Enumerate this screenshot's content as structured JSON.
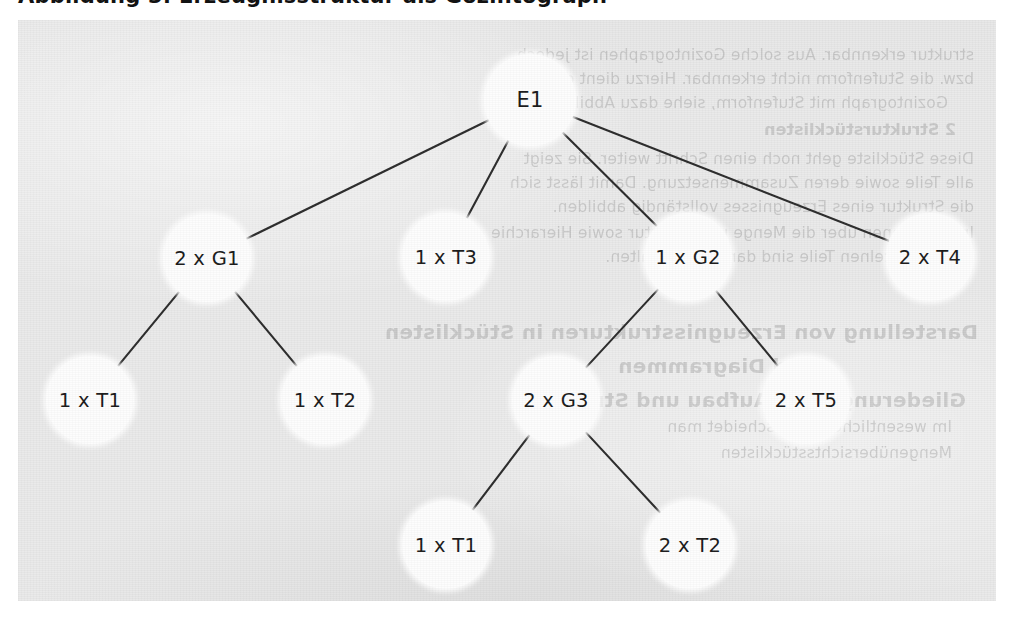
{
  "page": {
    "heading_cutoff": "Abbildung 3: Erzeugnisstruktur als Gozintograph",
    "panel_color": "#e9e9e9",
    "node_fill": "#fdfdfd",
    "line_color": "#2b2b2b",
    "text_color": "#1a1a1a"
  },
  "diagram": {
    "type": "tree",
    "nodes": [
      {
        "id": "E1",
        "label": "E1",
        "level": 0,
        "cx": 530,
        "cy": 100,
        "r": 46
      },
      {
        "id": "G1",
        "label": "2 x G1",
        "level": 1,
        "cx": 207,
        "cy": 258,
        "r": 44
      },
      {
        "id": "T3",
        "label": "1 x T3",
        "level": 1,
        "cx": 446,
        "cy": 257,
        "r": 44
      },
      {
        "id": "G2",
        "label": "1 x G2",
        "level": 1,
        "cx": 688,
        "cy": 257,
        "r": 44
      },
      {
        "id": "T4",
        "label": "2 x T4",
        "level": 1,
        "cx": 930,
        "cy": 257,
        "r": 44
      },
      {
        "id": "T1a",
        "label": "1 x T1",
        "level": 2,
        "cx": 90,
        "cy": 400,
        "r": 44
      },
      {
        "id": "T2a",
        "label": "1 x T2",
        "level": 2,
        "cx": 325,
        "cy": 400,
        "r": 44
      },
      {
        "id": "G3",
        "label": "2 x G3",
        "level": 2,
        "cx": 556,
        "cy": 400,
        "r": 44
      },
      {
        "id": "T5",
        "label": "2 x T5",
        "level": 2,
        "cx": 806,
        "cy": 400,
        "r": 44
      },
      {
        "id": "T1b",
        "label": "1 x T1",
        "level": 3,
        "cx": 446,
        "cy": 545,
        "r": 44
      },
      {
        "id": "T2b",
        "label": "2 x T2",
        "level": 3,
        "cx": 690,
        "cy": 545,
        "r": 44
      }
    ],
    "edges": [
      {
        "from": "E1",
        "to": "G1"
      },
      {
        "from": "E1",
        "to": "T3"
      },
      {
        "from": "E1",
        "to": "G2"
      },
      {
        "from": "E1",
        "to": "T4"
      },
      {
        "from": "G1",
        "to": "T1a"
      },
      {
        "from": "G1",
        "to": "T2a"
      },
      {
        "from": "G2",
        "to": "G3"
      },
      {
        "from": "G2",
        "to": "T5"
      },
      {
        "from": "G3",
        "to": "T1b"
      },
      {
        "from": "G3",
        "to": "T2b"
      }
    ]
  },
  "bleed_text": {
    "note": "faint mirrored show-through from reverse side of the scanned page",
    "lines": [
      {
        "text": "struktur erkennbar. Aus solche Gozintographen ist jedoch",
        "x": 22,
        "y": 26,
        "cls": "b-body"
      },
      {
        "text": "bzw. die Stufenform nicht erkennbar. Hierzu dient die",
        "x": 22,
        "y": 50,
        "cls": "b-body"
      },
      {
        "text": "Gozintograph mit Stufenform, siehe dazu Abbildung 4.",
        "x": 48,
        "y": 74,
        "cls": "b-body"
      },
      {
        "text": "2  Strukturstücklisten",
        "x": 40,
        "y": 100,
        "cls": "b-head"
      },
      {
        "text": "Diese Stückliste geht noch einen Schritt weiter. Sie zeigt",
        "x": 22,
        "y": 130,
        "cls": "b-body"
      },
      {
        "text": "alle Teile sowie deren Zusammensetzung. Damit lässt sich",
        "x": 22,
        "y": 154,
        "cls": "b-body"
      },
      {
        "text": "die Struktur eines Erzeugnisses vollständig abbilden.",
        "x": 22,
        "y": 178,
        "cls": "b-body"
      },
      {
        "text": "Informationen über die Menge und Struktur sowie Hierarchie",
        "x": 22,
        "y": 204,
        "cls": "b-body"
      },
      {
        "text": "der einzelnen Teile sind darin festgehalten.",
        "x": 48,
        "y": 228,
        "cls": "b-body"
      },
      {
        "text": "Darstellung von Erzeugnisstrukturen in Stücklisten",
        "x": 18,
        "y": 300,
        "cls": "b-big"
      },
      {
        "text": "und Diagrammen",
        "x": 180,
        "y": 334,
        "cls": "b-big"
      },
      {
        "text": "Gliederung nach Aufbau und Struktur",
        "x": 30,
        "y": 368,
        "cls": "b-big"
      },
      {
        "text": "Im wesentlichen unterscheidet man",
        "x": 44,
        "y": 398,
        "cls": "b-body"
      },
      {
        "text": "Mengenübersichtsstücklisten",
        "x": 44,
        "y": 424,
        "cls": "b-body"
      }
    ]
  }
}
